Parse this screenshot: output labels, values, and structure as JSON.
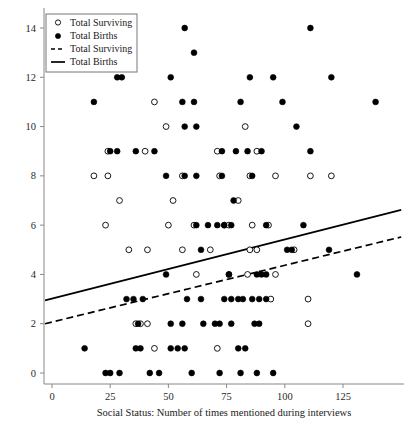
{
  "chart_data": {
    "type": "scatter",
    "title": "",
    "xlabel": "Social Status: Number of times mentioned during interviews",
    "ylabel": "",
    "xlim": [
      -8,
      145
    ],
    "ylim": [
      -0.7,
      14.9
    ],
    "xticks": [
      0,
      25,
      50,
      75,
      100,
      125
    ],
    "yticks": [
      0,
      2,
      4,
      6,
      8,
      10,
      12,
      14
    ],
    "grid": false,
    "legend_position": "top-left",
    "legend": [
      {
        "label": "Total Surviving",
        "marker": "open-circle",
        "type": "marker"
      },
      {
        "label": "Total Births",
        "marker": "filled-circle",
        "type": "marker"
      },
      {
        "label": "Total Surviving",
        "marker": "dashed-line",
        "type": "line"
      },
      {
        "label": "Total Births",
        "marker": "solid-line",
        "type": "line"
      }
    ],
    "series": [
      {
        "name": "Total Births",
        "marker": "filled-circle",
        "points": [
          [
            57,
            14
          ],
          [
            111,
            14
          ],
          [
            61,
            13
          ],
          [
            28,
            12
          ],
          [
            30,
            12
          ],
          [
            51,
            12
          ],
          [
            85,
            12
          ],
          [
            95,
            12
          ],
          [
            120,
            12
          ],
          [
            18,
            11
          ],
          [
            56,
            11
          ],
          [
            61,
            11
          ],
          [
            81,
            11
          ],
          [
            99,
            11
          ],
          [
            139,
            11
          ],
          [
            57,
            10
          ],
          [
            62,
            10
          ],
          [
            105,
            10
          ],
          [
            25,
            9
          ],
          [
            28,
            9
          ],
          [
            36,
            9
          ],
          [
            44,
            9
          ],
          [
            73,
            9
          ],
          [
            79,
            9
          ],
          [
            84,
            9
          ],
          [
            90,
            9
          ],
          [
            111,
            9
          ],
          [
            49,
            8
          ],
          [
            57,
            8
          ],
          [
            62,
            8
          ],
          [
            73,
            8
          ],
          [
            86,
            8
          ],
          [
            78,
            7
          ],
          [
            62,
            6
          ],
          [
            67,
            6
          ],
          [
            71,
            6
          ],
          [
            74,
            6
          ],
          [
            77,
            6
          ],
          [
            92,
            6
          ],
          [
            108,
            6
          ],
          [
            64,
            5
          ],
          [
            101,
            5
          ],
          [
            103,
            5
          ],
          [
            119,
            5
          ],
          [
            49,
            4
          ],
          [
            76,
            4
          ],
          [
            76,
            4
          ],
          [
            88,
            4
          ],
          [
            90,
            4
          ],
          [
            92,
            4
          ],
          [
            131,
            4
          ],
          [
            32,
            3
          ],
          [
            35,
            3
          ],
          [
            39,
            3
          ],
          [
            58,
            3
          ],
          [
            64,
            3
          ],
          [
            74,
            3
          ],
          [
            77,
            3
          ],
          [
            80,
            3
          ],
          [
            82,
            3
          ],
          [
            86,
            3
          ],
          [
            89,
            3
          ],
          [
            92,
            3
          ],
          [
            37,
            2
          ],
          [
            51,
            2
          ],
          [
            56,
            2
          ],
          [
            65,
            2
          ],
          [
            70,
            2
          ],
          [
            72,
            2
          ],
          [
            77,
            2
          ],
          [
            87,
            2
          ],
          [
            89,
            2
          ],
          [
            14,
            1
          ],
          [
            36,
            1
          ],
          [
            38,
            1
          ],
          [
            51,
            1
          ],
          [
            54,
            1
          ],
          [
            57,
            1
          ],
          [
            80,
            1
          ],
          [
            83,
            1
          ],
          [
            23,
            0
          ],
          [
            25,
            0
          ],
          [
            29,
            0
          ],
          [
            42,
            0
          ],
          [
            46,
            0
          ],
          [
            60,
            0
          ],
          [
            72,
            0
          ],
          [
            81,
            0
          ],
          [
            88,
            0
          ],
          [
            95,
            0
          ]
        ]
      },
      {
        "name": "Total Surviving",
        "marker": "open-circle",
        "points": [
          [
            44,
            11
          ],
          [
            49,
            10
          ],
          [
            83,
            10
          ],
          [
            24,
            9
          ],
          [
            40,
            9
          ],
          [
            71,
            9
          ],
          [
            88,
            9
          ],
          [
            18,
            8
          ],
          [
            24,
            8
          ],
          [
            56,
            8
          ],
          [
            72,
            8
          ],
          [
            85,
            8
          ],
          [
            96,
            8
          ],
          [
            111,
            8
          ],
          [
            120,
            8
          ],
          [
            29,
            7
          ],
          [
            52,
            7
          ],
          [
            80,
            7
          ],
          [
            23,
            6
          ],
          [
            50,
            6
          ],
          [
            61,
            6
          ],
          [
            74,
            6
          ],
          [
            76,
            6
          ],
          [
            86,
            6
          ],
          [
            93,
            6
          ],
          [
            33,
            5
          ],
          [
            41,
            5
          ],
          [
            56,
            5
          ],
          [
            68,
            5
          ],
          [
            85,
            5
          ],
          [
            88,
            5
          ],
          [
            104,
            5
          ],
          [
            62,
            4
          ],
          [
            84,
            4
          ],
          [
            96,
            4
          ],
          [
            94,
            3
          ],
          [
            110,
            3
          ],
          [
            36,
            2
          ],
          [
            38,
            2
          ],
          [
            41,
            2
          ],
          [
            110,
            2
          ],
          [
            44,
            1
          ],
          [
            71,
            1
          ]
        ]
      }
    ],
    "fit_lines": [
      {
        "name": "Total Births",
        "style": "solid",
        "x_start": -3,
        "y_start": 2.95,
        "x_end": 150,
        "y_end": 6.62
      },
      {
        "name": "Total Surviving",
        "style": "dashed",
        "x_start": -3,
        "y_start": 2.0,
        "x_end": 150,
        "y_end": 5.52
      }
    ]
  }
}
